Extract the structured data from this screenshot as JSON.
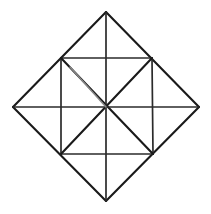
{
  "figure": {
    "background_color": "#ffffff",
    "line_color": "#1a1a1a",
    "faint_line_color": "#8a8a8a",
    "line_width": "2.1",
    "canvas": {
      "width": 211,
      "height": 214
    },
    "center_point": {
      "x": 106,
      "y": 107
    },
    "vertices": {
      "diamond_top": {
        "label": "top",
        "x": 106,
        "y": 12
      },
      "diamond_right": {
        "label": "right",
        "x": 199,
        "y": 107
      },
      "diamond_bottom": {
        "label": "bottom",
        "x": 106,
        "y": 201
      },
      "diamond_left": {
        "label": "left",
        "x": 13,
        "y": 107
      },
      "square_top_left": {
        "label": "top-left",
        "x": 61,
        "y": 58
      },
      "square_top_right": {
        "label": "top-right",
        "x": 152,
        "y": 58
      },
      "square_bottom_right": {
        "label": "bottom-right",
        "x": 153,
        "y": 154
      },
      "square_bottom_left": {
        "label": "bottom-left",
        "x": 61,
        "y": 154
      }
    },
    "edges": [
      {
        "name": "diamond-edge-top-left",
        "x1": 13,
        "y1": 107,
        "x2": 106,
        "y2": 12,
        "weight": "bold"
      },
      {
        "name": "diamond-edge-top-right",
        "x1": 106,
        "y1": 12,
        "x2": 199,
        "y2": 107,
        "weight": "bold"
      },
      {
        "name": "diamond-edge-bottom-right",
        "x1": 199,
        "y1": 107,
        "x2": 106,
        "y2": 201,
        "weight": "bold"
      },
      {
        "name": "diamond-edge-bottom-left",
        "x1": 106,
        "y1": 201,
        "x2": 13,
        "y2": 107,
        "weight": "bold"
      },
      {
        "name": "square-edge-top",
        "x1": 61,
        "y1": 58,
        "x2": 152,
        "y2": 58,
        "weight": "normal"
      },
      {
        "name": "square-edge-right",
        "x1": 152,
        "y1": 58,
        "x2": 153,
        "y2": 154,
        "weight": "normal"
      },
      {
        "name": "square-edge-bottom",
        "x1": 153,
        "y1": 154,
        "x2": 61,
        "y2": 154,
        "weight": "normal"
      },
      {
        "name": "square-edge-left",
        "x1": 61,
        "y1": 154,
        "x2": 61,
        "y2": 58,
        "weight": "normal"
      },
      {
        "name": "square-diagonal-nwse",
        "x1": 61,
        "y1": 58,
        "x2": 153,
        "y2": 154,
        "weight": "bold"
      },
      {
        "name": "square-diagonal-nesw",
        "x1": 152,
        "y1": 58,
        "x2": 61,
        "y2": 154,
        "weight": "bold"
      },
      {
        "name": "median-horizontal",
        "x1": 13,
        "y1": 107,
        "x2": 199,
        "y2": 107,
        "weight": "normal"
      },
      {
        "name": "median-vertical",
        "x1": 106,
        "y1": 12,
        "x2": 106,
        "y2": 201,
        "weight": "normal"
      }
    ],
    "faint_edges": [
      {
        "name": "square-diagonal-nwse-faded-segment",
        "x1": 70,
        "y1": 67,
        "x2": 106,
        "y2": 107
      }
    ]
  }
}
